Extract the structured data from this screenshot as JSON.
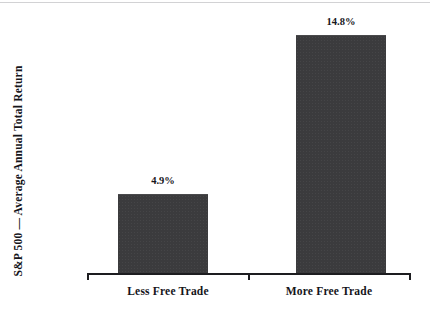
{
  "chart_data": {
    "type": "bar",
    "title": "",
    "subtitle": "",
    "categories": [
      "Less Free Trade",
      "More Free Trade"
    ],
    "values": [
      4.9,
      14.8
    ],
    "data_labels": [
      "4.9%",
      "14.8%"
    ],
    "series": [
      {
        "name": "S&P 500 Average Annual Total Return",
        "values": [
          4.9,
          14.8
        ]
      }
    ],
    "xlabel": "",
    "ylabel": "S&P 500 — Average Annual Total Return",
    "ylim": [
      0,
      16.4
    ],
    "grid": false,
    "legend": false,
    "legend_position": "none",
    "units": "percent",
    "bar_color": "#3b3b3d",
    "axis_color": "#1d1d20",
    "text_color": "#15151a",
    "background": "#ffffff"
  },
  "axes": {
    "y_title": "S&P 500 — Average Annual Total Return",
    "x_tick_labels": [
      "Less Free Trade",
      "More Free Trade"
    ]
  },
  "labels": {
    "bar_1_value": "4.9%",
    "bar_2_value": "14.8%"
  }
}
